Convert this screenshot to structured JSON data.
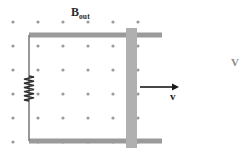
{
  "figure": {
    "width": 239,
    "height": 167,
    "background": "#ffffff"
  },
  "labels": {
    "field_symbol": "B",
    "field_subscript": "out",
    "velocity_symbol": "v",
    "edge_partial": "V"
  },
  "colors": {
    "rail": "#9a9a9a",
    "bar": "#b0b0b0",
    "wire": "#6e6e6e",
    "dot": "#9a9a9a",
    "arrow": "#1a1a1a",
    "text": "#2b2b2b"
  },
  "geometry": {
    "dot_grid": {
      "columns": 6,
      "rows": 6,
      "x_start": 13,
      "y_start": 22,
      "x_spacing": 25,
      "y_spacing": 24,
      "radius": 1.6
    },
    "top_rail": {
      "x1": 29,
      "x2": 162,
      "y": 35,
      "thickness": 5
    },
    "bottom_rail": {
      "x1": 29,
      "x2": 162,
      "y": 141,
      "thickness": 5
    },
    "left_wire": {
      "x": 29,
      "y1": 35,
      "y2": 141,
      "thickness": 1.4
    },
    "resistor": {
      "x": 29,
      "y_top": 76,
      "y_bottom": 101,
      "amplitude": 5,
      "zigs": 6
    },
    "slider_bar": {
      "x": 126,
      "y": 28,
      "width": 11,
      "height": 120
    },
    "velocity_arrow": {
      "x1": 140,
      "x2": 179,
      "y": 87,
      "head_length": 7,
      "head_width": 7
    }
  }
}
